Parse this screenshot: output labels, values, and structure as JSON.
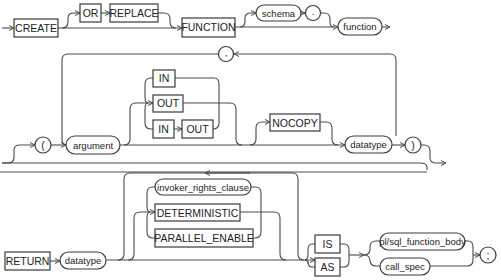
{
  "diagram": {
    "row1": {
      "create": "CREATE",
      "or": "OR",
      "replace": "REPLACE",
      "function_kw": "FUNCTION",
      "schema": "schema",
      "dot": ".",
      "function_name": "function"
    },
    "row2": {
      "comma": ",",
      "open_paren": "(",
      "argument": "argument",
      "in": "IN",
      "out": "OUT",
      "in2": "IN",
      "out2": "OUT",
      "nocopy": "NOCOPY",
      "datatype": "datatype",
      "close_paren": ")"
    },
    "row3": {
      "return_kw": "RETURN",
      "datatype": "datatype",
      "invoker_rights_clause": "invoker_rights_clause",
      "deterministic": "DETERMINISTIC",
      "parallel_enable": "PARALLEL_ENABLE",
      "is": "IS",
      "as": "AS",
      "plsql_function_body": "pl/sql_function_body",
      "call_spec": "call_spec",
      "semicolon": ";"
    },
    "colors": {
      "line": "#4a4a4a",
      "box_border": "#3a3a3a",
      "background": "#ffffff"
    }
  }
}
